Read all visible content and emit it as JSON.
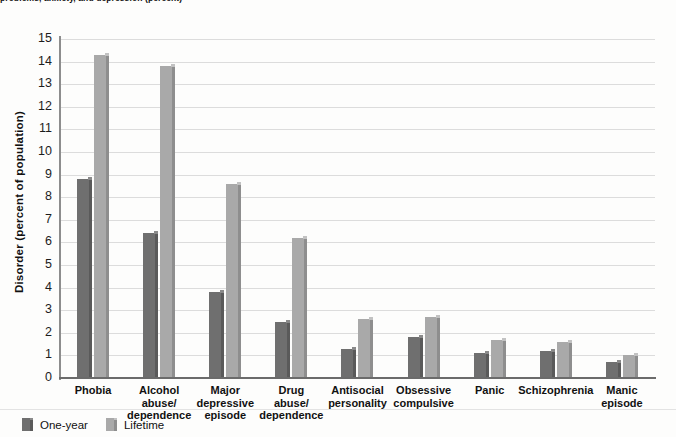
{
  "figure": {
    "caption_sliver": "problems, anxiety, and depression (percent)",
    "ylabel": "Disorder (percent of population)"
  },
  "legend": {
    "position": "bottom-left",
    "items": [
      {
        "label": "One-year",
        "color": "#6f6f6f",
        "name": "legend-one-year"
      },
      {
        "label": "Lifetime",
        "color": "#a9a9a9",
        "name": "legend-lifetime"
      }
    ]
  },
  "chart_data": {
    "type": "bar",
    "title": "",
    "subtitle": "",
    "xlabel": "",
    "ylabel": "Disorder (percent of population)",
    "ylim": [
      0,
      15
    ],
    "ytick_step": 1,
    "ytick_labels": [
      "15",
      "14",
      "13",
      "12",
      "11",
      "10",
      "9",
      "8",
      "7",
      "6",
      "5",
      "4",
      "3",
      "2",
      "1",
      "0"
    ],
    "grid": true,
    "legend_position": "bottom-left",
    "categories": [
      "Phobia",
      "Alcohol abuse/ dependence",
      "Major depressive episode",
      "Drug abuse/ dependence",
      "Antisocial personality",
      "Obsessive compulsive",
      "Panic",
      "Schizophrenia",
      "Manic episode"
    ],
    "category_lines": [
      [
        "Phobia"
      ],
      [
        "Alcohol",
        "abuse/",
        "dependence"
      ],
      [
        "Major",
        "depressive",
        "episode"
      ],
      [
        "Drug",
        "abuse/",
        "dependence"
      ],
      [
        "Antisocial",
        "personality"
      ],
      [
        "Obsessive",
        "compulsive"
      ],
      [
        "Panic"
      ],
      [
        "Schizophrenia"
      ],
      [
        "Manic",
        "episode"
      ]
    ],
    "series": [
      {
        "name": "One-year",
        "color": "#6f6f6f",
        "values": [
          8.8,
          6.4,
          3.8,
          2.5,
          1.3,
          1.8,
          1.1,
          1.2,
          0.7
        ]
      },
      {
        "name": "Lifetime",
        "color": "#a9a9a9",
        "values": [
          14.3,
          13.8,
          8.6,
          6.2,
          2.6,
          2.7,
          1.7,
          1.6,
          1.0
        ]
      }
    ]
  }
}
